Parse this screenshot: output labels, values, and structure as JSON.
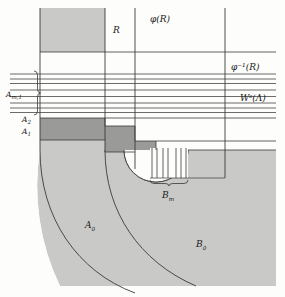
{
  "figure": {
    "type": "mathematical-diagram",
    "background_color": "#fdfdfc",
    "light_gray": "#c9c9c7",
    "dark_gray": "#9a9a99",
    "line_color": "#3a3a3a",
    "labels": {
      "R": "R",
      "phi_R": "φ(R)",
      "phi_inv_R": "φ⁻¹(R)",
      "Ws_Lambda": "Wˢ(Λ)",
      "A_m1": "A",
      "A_m1_sub": "m,1",
      "A_2": "A",
      "A_2_sub": "2",
      "A_1": "A",
      "A_1_sub": "1",
      "A_0": "A",
      "A_0_sub": "0",
      "B_m": "B",
      "B_m_sub": "m",
      "B_0": "B",
      "B_0_sub": "0"
    },
    "geometry": {
      "vertical_lines_x": [
        105,
        135,
        225
      ],
      "gray_strip_top": {
        "x": 40,
        "y": 8,
        "width": 65,
        "height": 44
      },
      "horizontal_rule_y": 52,
      "stable_leaves_y": [
        74,
        79,
        83,
        90,
        96,
        103,
        108,
        112
      ],
      "staircase_steps": [
        {
          "x": 40,
          "y": 118,
          "width": 65,
          "height": 22
        },
        {
          "x": 105,
          "y": 126,
          "width": 30,
          "height": 26
        },
        {
          "x": 135,
          "y": 141,
          "width": 21,
          "height": 28
        }
      ],
      "arc_outer_center": [
        156,
        150
      ],
      "brace_Bm": {
        "x1": 150,
        "x2": 188,
        "y": 181
      },
      "vertical_strips_x": [
        152,
        157,
        163,
        168,
        176,
        181,
        186
      ],
      "strips_y_top": 148,
      "strips_y_bottom": 178
    }
  }
}
